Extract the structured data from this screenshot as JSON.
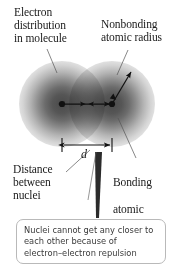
{
  "figure": {
    "background_color": "#ffffff",
    "cloud_color": "#4a4a4a",
    "line_color": "#1a1a1a",
    "box_border_color": "#b9b9b9",
    "caption_text_color": "#3b3b3b"
  },
  "labels": {
    "electron_distribution": "Electron\ndistribution\nin molecule",
    "nonbonding_radius": "Nonbonding\natomic radius",
    "distance_between_nuclei": "Distance\nbetween\nnuclei",
    "bonding_radius_line1": "Bonding",
    "bonding_radius_line2": "atomic",
    "bonding_radius_line3_prefix": "radius, ",
    "bonding_radius_fraction_numerator": "1",
    "bonding_radius_fraction_denominator": "2",
    "bonding_radius_variable": "d"
  },
  "dimension": {
    "letter": "d",
    "meaning": "internuclear distance"
  },
  "caption": {
    "text": "Nuclei cannot get any closer to\neach other because of\nelectron–electron repulsion"
  },
  "diagram": {
    "nucleus_left_label": "left-nucleus",
    "nucleus_right_label": "right-nucleus",
    "arrow_internuclear": "double-headed arrow spanning the two nuclei",
    "arrow_nonbonding": "arrow from right nucleus outward to cloud edge"
  }
}
